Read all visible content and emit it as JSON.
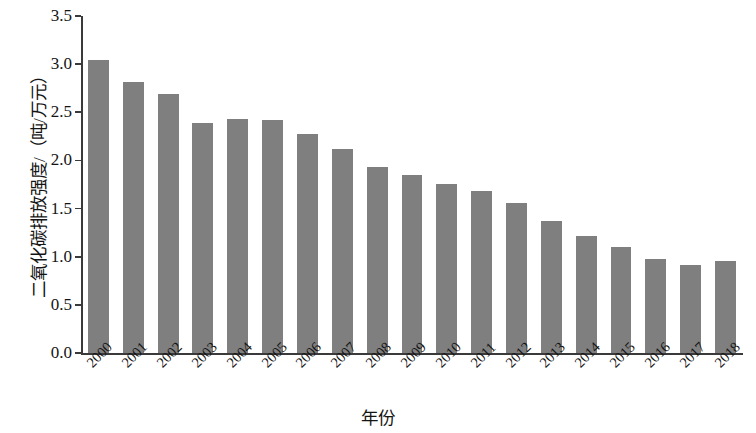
{
  "chart_data": {
    "type": "bar",
    "title": "",
    "xlabel": "年份",
    "ylabel": "二氧化碳排放强度/（吨/万元）",
    "categories": [
      "2000",
      "2001",
      "2002",
      "2003",
      "2004",
      "2005",
      "2006",
      "2007",
      "2008",
      "2009",
      "2010",
      "2011",
      "2012",
      "2013",
      "2014",
      "2015",
      "2016",
      "2017",
      "2018"
    ],
    "values": [
      3.04,
      2.81,
      2.69,
      2.39,
      2.43,
      2.42,
      2.27,
      2.12,
      1.93,
      1.85,
      1.76,
      1.68,
      1.56,
      1.37,
      1.22,
      1.1,
      0.98,
      0.91,
      0.96
    ],
    "series": [
      {
        "name": "二氧化碳排放强度",
        "values": [
          3.04,
          2.81,
          2.69,
          2.39,
          2.43,
          2.42,
          2.27,
          2.12,
          1.93,
          1.85,
          1.76,
          1.68,
          1.56,
          1.37,
          1.22,
          1.1,
          0.98,
          0.91,
          0.96
        ]
      }
    ],
    "ylim": [
      0.0,
      3.5
    ],
    "ytick_labels": [
      "0.0",
      "0.5",
      "1.0",
      "1.5",
      "2.0",
      "2.5",
      "3.0",
      "3.5"
    ],
    "ytick_values": [
      0.0,
      0.5,
      1.0,
      1.5,
      2.0,
      2.5,
      3.0,
      3.5
    ],
    "grid": false,
    "legend": false,
    "legend_position": "none",
    "bar_color": "#7f7f7f",
    "axis_color": "#3a3a3a",
    "background_color": "#ffffff",
    "xtick_rotation_deg": -45
  }
}
